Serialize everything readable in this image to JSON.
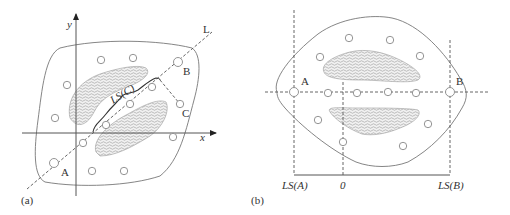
{
  "panel_a": {
    "caption": "(a)",
    "axis_x_label": "x",
    "axis_y_label": "y",
    "line_label": "L",
    "point_labels": {
      "A": "A",
      "B": "B",
      "C": "C"
    },
    "curve_label": "LS(C)",
    "circles": [
      [
        101,
        60
      ],
      [
        133,
        58
      ],
      [
        67,
        85
      ],
      [
        55,
        118
      ],
      [
        54,
        163
      ],
      [
        83,
        143
      ],
      [
        92,
        171
      ],
      [
        124,
        171
      ],
      [
        106,
        125
      ],
      [
        130,
        104
      ],
      [
        152,
        87
      ],
      [
        178,
        62
      ],
      [
        180,
        104
      ],
      [
        173,
        137
      ]
    ]
  },
  "panel_b": {
    "caption": "(b)",
    "point_labels": {
      "A": "A",
      "B": "B"
    },
    "axis_labels": {
      "ls_a": "LS(A)",
      "zero": "0",
      "ls_b": "LS(B)"
    },
    "circles": [
      [
        349,
        38
      ],
      [
        390,
        40
      ],
      [
        320,
        57
      ],
      [
        420,
        56
      ],
      [
        294,
        92
      ],
      [
        328,
        93
      ],
      [
        357,
        93
      ],
      [
        388,
        92
      ],
      [
        416,
        93
      ],
      [
        450,
        92
      ],
      [
        318,
        120
      ],
      [
        428,
        124
      ],
      [
        343,
        141
      ],
      [
        403,
        146
      ]
    ]
  },
  "colors": {
    "line": "#555555",
    "outline": "#777777",
    "hatch": "#9a9a9a",
    "background": "#ffffff"
  }
}
